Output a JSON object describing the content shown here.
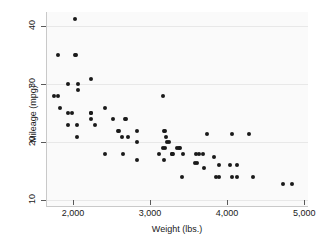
{
  "chart_data": {
    "type": "scatter",
    "title": "",
    "xlabel": "Weight (lbs.)",
    "ylabel": "Mileage (mpg)",
    "xlim": [
      1650,
      5050
    ],
    "ylim": [
      9,
      42.5
    ],
    "xticks": [
      2000,
      3000,
      4000,
      5000
    ],
    "xticklabels": [
      "2,000",
      "3,000",
      "4,000",
      "5,000"
    ],
    "yticks": [
      10,
      20,
      30,
      40
    ],
    "yticklabels": [
      "10",
      "20",
      "30",
      "40"
    ],
    "grid": true,
    "grid_axis": "y",
    "legend": "none",
    "marker": "filled-circle",
    "marker_color": "#1a1a1a",
    "background_color": "#fafafa",
    "gridline_color": "#e8e8e8",
    "axis_color": "#c9c9c9",
    "n_points": 74,
    "points": [
      {
        "x": 2020,
        "y": 41.3
      },
      {
        "x": 1800,
        "y": 35.0
      },
      {
        "x": 2020,
        "y": 35.0
      },
      {
        "x": 2040,
        "y": 35.0
      },
      {
        "x": 2230,
        "y": 31.0
      },
      {
        "x": 1930,
        "y": 30.0
      },
      {
        "x": 2070,
        "y": 30.0
      },
      {
        "x": 2070,
        "y": 29.0
      },
      {
        "x": 3170,
        "y": 28.0
      },
      {
        "x": 1760,
        "y": 28.0
      },
      {
        "x": 1800,
        "y": 28.0
      },
      {
        "x": 1830,
        "y": 26.0
      },
      {
        "x": 2410,
        "y": 26.0
      },
      {
        "x": 1930,
        "y": 25.0
      },
      {
        "x": 1990,
        "y": 25.0
      },
      {
        "x": 2230,
        "y": 25.0
      },
      {
        "x": 2240,
        "y": 25.0
      },
      {
        "x": 2520,
        "y": 24.0
      },
      {
        "x": 2670,
        "y": 24.0
      },
      {
        "x": 2690,
        "y": 24.0
      },
      {
        "x": 2240,
        "y": 24.0
      },
      {
        "x": 1930,
        "y": 23.0
      },
      {
        "x": 2050,
        "y": 23.0
      },
      {
        "x": 2280,
        "y": 23.0
      },
      {
        "x": 2580,
        "y": 22.0
      },
      {
        "x": 2600,
        "y": 22.0
      },
      {
        "x": 2830,
        "y": 22.0
      },
      {
        "x": 3180,
        "y": 22.0
      },
      {
        "x": 3200,
        "y": 22.0
      },
      {
        "x": 3740,
        "y": 21.5
      },
      {
        "x": 4060,
        "y": 21.5
      },
      {
        "x": 4290,
        "y": 21.5
      },
      {
        "x": 2050,
        "y": 21.0
      },
      {
        "x": 2640,
        "y": 21.0
      },
      {
        "x": 2720,
        "y": 21.0
      },
      {
        "x": 3210,
        "y": 21.0
      },
      {
        "x": 2830,
        "y": 20.0
      },
      {
        "x": 3220,
        "y": 20.0
      },
      {
        "x": 3240,
        "y": 20.0
      },
      {
        "x": 3170,
        "y": 19.0
      },
      {
        "x": 3190,
        "y": 19.0
      },
      {
        "x": 3350,
        "y": 19.0
      },
      {
        "x": 3370,
        "y": 19.0
      },
      {
        "x": 3390,
        "y": 19.0
      },
      {
        "x": 3110,
        "y": 18.0
      },
      {
        "x": 3280,
        "y": 18.0
      },
      {
        "x": 3300,
        "y": 18.0
      },
      {
        "x": 3430,
        "y": 18.0
      },
      {
        "x": 3600,
        "y": 18.0
      },
      {
        "x": 3630,
        "y": 18.0
      },
      {
        "x": 3690,
        "y": 18.0
      },
      {
        "x": 2410,
        "y": 18.0
      },
      {
        "x": 2650,
        "y": 18.0
      },
      {
        "x": 3280,
        "y": 18.0
      },
      {
        "x": 3830,
        "y": 17.5
      },
      {
        "x": 2830,
        "y": 17.0
      },
      {
        "x": 3180,
        "y": 17.0
      },
      {
        "x": 3590,
        "y": 16.5
      },
      {
        "x": 3610,
        "y": 16.5
      },
      {
        "x": 3900,
        "y": 16.0
      },
      {
        "x": 4040,
        "y": 16.0
      },
      {
        "x": 4130,
        "y": 16.0
      },
      {
        "x": 3700,
        "y": 15.5
      },
      {
        "x": 3420,
        "y": 14.0
      },
      {
        "x": 3850,
        "y": 14.0
      },
      {
        "x": 3900,
        "y": 14.0
      },
      {
        "x": 4060,
        "y": 14.0
      },
      {
        "x": 4130,
        "y": 14.0
      },
      {
        "x": 4330,
        "y": 14.0
      },
      {
        "x": 4720,
        "y": 12.8
      },
      {
        "x": 4840,
        "y": 12.8
      }
    ]
  }
}
